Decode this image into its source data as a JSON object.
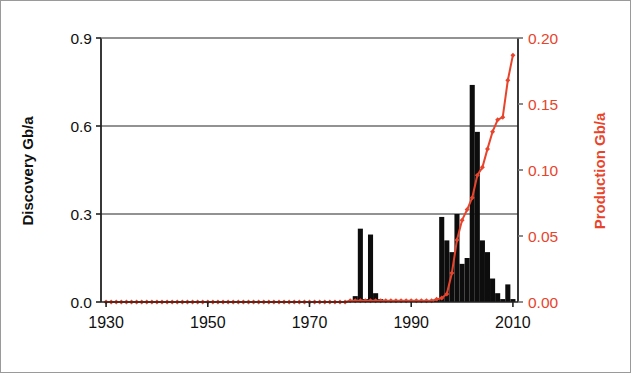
{
  "figure": {
    "background": "#ffffff",
    "border_color": "#9a9a9a",
    "bar_color": "#0d0d0d",
    "line_color": "#e8442c",
    "grid_color": "#6e6e6e",
    "axis_color": "#222222"
  },
  "labels": {
    "left_axis_title": "Discovery Gb/a",
    "right_axis_title": "Production Gb/a"
  },
  "ticks": {
    "left": [
      "0.0",
      "0.3",
      "0.6",
      "0.9"
    ],
    "right": [
      "0.00",
      "0.05",
      "0.10",
      "0.15",
      "0.20"
    ],
    "x": [
      "1930",
      "1950",
      "1970",
      "1990",
      "2010"
    ]
  },
  "chart_data": {
    "type": "bar",
    "title": "",
    "xlabel": "",
    "ylabel": "Discovery Gb/a",
    "y2label": "Production Gb/a",
    "xlim": [
      1929,
      2011
    ],
    "ylim": [
      0.0,
      0.9
    ],
    "y2lim": [
      0.0,
      0.2
    ],
    "grid": true,
    "gridlines_y": [
      0.3,
      0.6
    ],
    "legend_position": "none",
    "xticks": [
      1930,
      1950,
      1970,
      1990,
      2010
    ],
    "yticks": [
      0.0,
      0.3,
      0.6,
      0.9
    ],
    "y2ticks": [
      0.0,
      0.05,
      0.1,
      0.15,
      0.2
    ],
    "series": [
      {
        "name": "Discovery",
        "type": "bar",
        "axis": "left",
        "color": "#0d0d0d",
        "units": "Gb/a",
        "x": [
          1930,
          1931,
          1932,
          1933,
          1934,
          1935,
          1936,
          1937,
          1938,
          1939,
          1940,
          1941,
          1942,
          1943,
          1944,
          1945,
          1946,
          1947,
          1948,
          1949,
          1950,
          1951,
          1952,
          1953,
          1954,
          1955,
          1956,
          1957,
          1958,
          1959,
          1960,
          1961,
          1962,
          1963,
          1964,
          1965,
          1966,
          1967,
          1968,
          1969,
          1970,
          1971,
          1972,
          1973,
          1974,
          1975,
          1976,
          1977,
          1978,
          1979,
          1980,
          1981,
          1982,
          1983,
          1984,
          1985,
          1986,
          1987,
          1988,
          1989,
          1990,
          1991,
          1992,
          1993,
          1994,
          1995,
          1996,
          1997,
          1998,
          1999,
          2000,
          2001,
          2002,
          2003,
          2004,
          2005,
          2006,
          2007,
          2008,
          2009,
          2010
        ],
        "values": [
          0,
          0,
          0,
          0,
          0,
          0,
          0,
          0,
          0,
          0,
          0,
          0,
          0,
          0,
          0,
          0,
          0,
          0,
          0,
          0,
          0,
          0,
          0,
          0,
          0,
          0,
          0,
          0,
          0,
          0,
          0,
          0,
          0,
          0,
          0,
          0,
          0,
          0,
          0,
          0,
          0,
          0,
          0,
          0,
          0,
          0,
          0,
          0,
          0,
          0.02,
          0.25,
          0.01,
          0.23,
          0.03,
          0.01,
          0,
          0,
          0,
          0,
          0,
          0,
          0,
          0,
          0,
          0,
          0.01,
          0.29,
          0.21,
          0.17,
          0.3,
          0.13,
          0.15,
          0.74,
          0.58,
          0.21,
          0.17,
          0.08,
          0.03,
          0.01,
          0.06,
          0.01
        ]
      },
      {
        "name": "Production",
        "type": "line",
        "axis": "right",
        "color": "#e8442c",
        "marker": "diamond",
        "units": "Gb/a",
        "x": [
          1930,
          1931,
          1932,
          1933,
          1934,
          1935,
          1936,
          1937,
          1938,
          1939,
          1940,
          1941,
          1942,
          1943,
          1944,
          1945,
          1946,
          1947,
          1948,
          1949,
          1950,
          1951,
          1952,
          1953,
          1954,
          1955,
          1956,
          1957,
          1958,
          1959,
          1960,
          1961,
          1962,
          1963,
          1964,
          1965,
          1966,
          1967,
          1968,
          1969,
          1970,
          1971,
          1972,
          1973,
          1974,
          1975,
          1976,
          1977,
          1978,
          1979,
          1980,
          1981,
          1982,
          1983,
          1984,
          1985,
          1986,
          1987,
          1988,
          1989,
          1990,
          1991,
          1992,
          1993,
          1994,
          1995,
          1996,
          1997,
          1998,
          1999,
          2000,
          2001,
          2002,
          2003,
          2004,
          2005,
          2006,
          2007,
          2008,
          2009,
          2010
        ],
        "values": [
          0.0,
          0.0,
          0.0,
          0.0,
          0.0,
          0.0,
          0.0,
          0.0,
          0.0,
          0.0,
          0.0,
          0.0,
          0.0,
          0.0,
          0.0,
          0.0,
          0.0,
          0.0,
          0.0,
          0.0,
          0.0,
          0.0,
          0.0,
          0.0,
          0.0,
          0.0,
          0.0,
          0.0,
          0.0,
          0.0,
          0.0,
          0.0,
          0.0,
          0.0,
          0.0,
          0.0,
          0.0,
          0.0,
          0.0,
          0.0,
          0.0,
          0.0,
          0.0,
          0.0,
          0.0,
          0.0,
          0.0,
          0.0,
          0.001,
          0.001,
          0.001,
          0.001,
          0.001,
          0.001,
          0.001,
          0.001,
          0.001,
          0.001,
          0.001,
          0.001,
          0.001,
          0.001,
          0.001,
          0.001,
          0.001,
          0.002,
          0.003,
          0.006,
          0.022,
          0.047,
          0.062,
          0.07,
          0.079,
          0.096,
          0.102,
          0.116,
          0.129,
          0.138,
          0.14,
          0.168,
          0.187
        ]
      }
    ]
  }
}
